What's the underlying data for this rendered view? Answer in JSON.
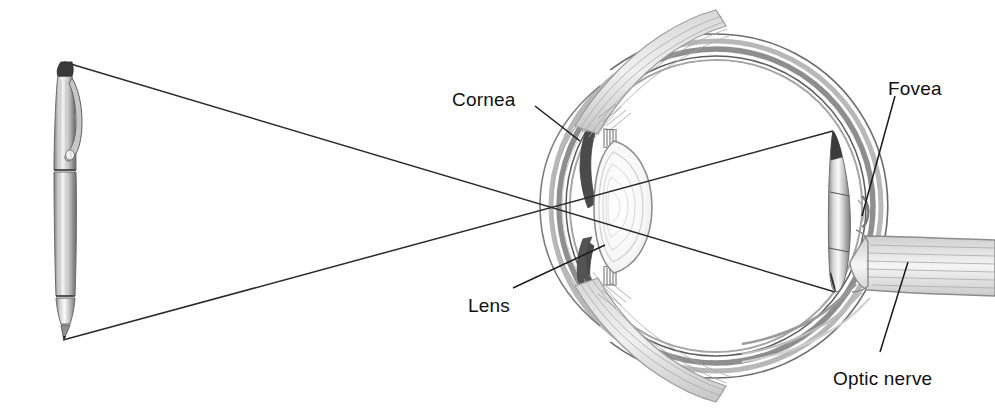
{
  "figure": {
    "background_color": "#ffffff",
    "ink_color": "#1a1a1a",
    "width": 995,
    "height": 412
  },
  "labels": [
    {
      "id": "cornea",
      "text": "Cornea",
      "x": 452,
      "y": 89,
      "anchor": "start"
    },
    {
      "id": "lens",
      "text": "Lens",
      "x": 468,
      "y": 295,
      "anchor": "start"
    },
    {
      "id": "fovea",
      "text": "Fovea",
      "x": 888,
      "y": 78,
      "anchor": "start"
    },
    {
      "id": "optic_nerve",
      "text": "Optic nerve",
      "x": 833,
      "y": 368,
      "anchor": "start"
    }
  ],
  "leader_lines": [
    {
      "id": "cornea-leader",
      "from": [
        535,
        106
      ],
      "to": [
        580,
        141
      ]
    },
    {
      "id": "lens-leader",
      "from": [
        513,
        288
      ],
      "to": [
        605,
        245
      ]
    },
    {
      "id": "fovea-leader",
      "from": [
        895,
        96
      ],
      "to": [
        862,
        216
      ]
    },
    {
      "id": "optic-nerve-leader",
      "from": [
        880,
        352
      ],
      "to": [
        908,
        262
      ]
    }
  ],
  "object": {
    "name": "pen",
    "top": [
      64,
      62
    ],
    "tip": [
      63,
      340
    ],
    "description": "upright silver ballpoint pen with pocket clip, drawn at left"
  },
  "image_on_retina": {
    "name": "inverted-pen-image",
    "top": [
      833,
      131
    ],
    "tip": [
      835,
      292
    ],
    "description": "inverted miniature pen projected on the retina"
  },
  "light_rays": [
    {
      "id": "ray-top",
      "from": [
        64,
        62
      ],
      "to": [
        835,
        292
      ],
      "note": "from pen top through lens to lower retina"
    },
    {
      "id": "ray-bottom",
      "from": [
        63,
        340
      ],
      "to": [
        833,
        131
      ],
      "note": "from pen tip through lens to upper retina"
    }
  ],
  "anatomy": {
    "globe_center": [
      716,
      206
    ],
    "globe_radius": 172,
    "parts": [
      "sclera",
      "choroid",
      "retina",
      "cornea",
      "iris",
      "lens",
      "ciliary body",
      "zonule fibers",
      "extraocular muscle",
      "fovea",
      "optic disc",
      "optic nerve"
    ]
  }
}
